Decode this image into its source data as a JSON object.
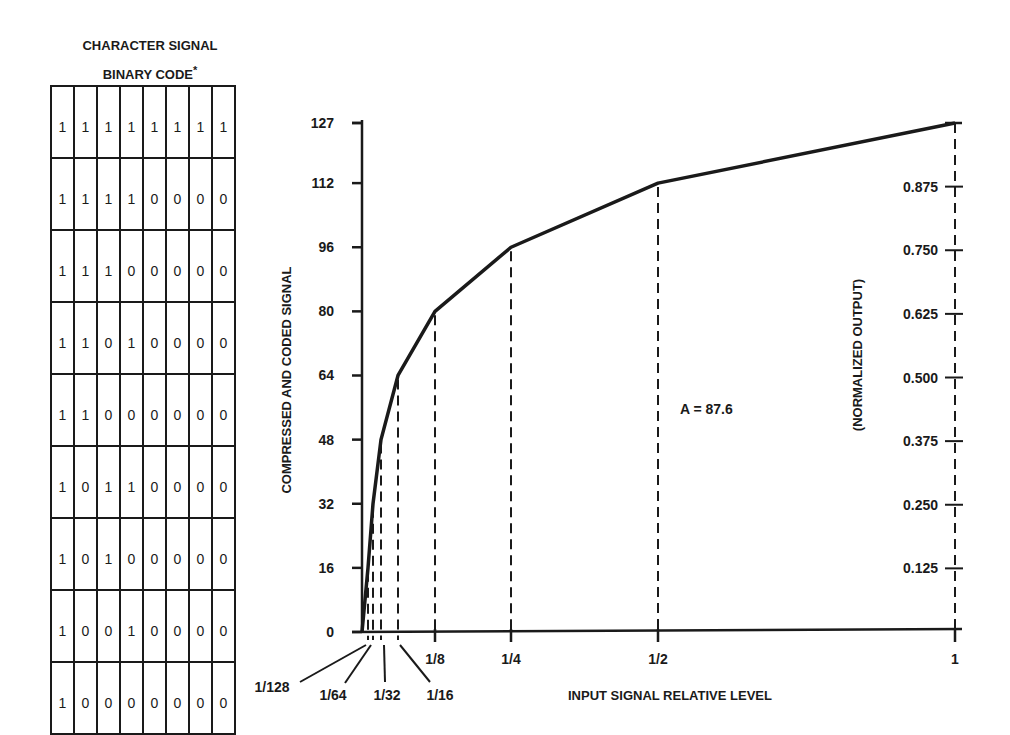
{
  "table": {
    "title_line1": "CHARACTER SIGNAL",
    "title_line2": "BINARY CODE",
    "title_mark": "*",
    "rows": [
      [
        "1",
        "1",
        "1",
        "1",
        "1",
        "1",
        "1",
        "1"
      ],
      [
        "1",
        "1",
        "1",
        "1",
        "0",
        "0",
        "0",
        "0"
      ],
      [
        "1",
        "1",
        "1",
        "0",
        "0",
        "0",
        "0",
        "0"
      ],
      [
        "1",
        "1",
        "0",
        "1",
        "0",
        "0",
        "0",
        "0"
      ],
      [
        "1",
        "1",
        "0",
        "0",
        "0",
        "0",
        "0",
        "0"
      ],
      [
        "1",
        "0",
        "1",
        "1",
        "0",
        "0",
        "0",
        "0"
      ],
      [
        "1",
        "0",
        "1",
        "0",
        "0",
        "0",
        "0",
        "0"
      ],
      [
        "1",
        "0",
        "0",
        "1",
        "0",
        "0",
        "0",
        "0"
      ],
      [
        "1",
        "0",
        "0",
        "0",
        "0",
        "0",
        "0",
        "0"
      ]
    ]
  },
  "chart": {
    "ylabel": "COMPRESSED AND CODED SIGNAL",
    "y2label": "(NORMALIZED OUTPUT)",
    "xlabel": "INPUT SIGNAL RELATIVE LEVEL",
    "annotation": "A = 87.6",
    "y_ticks": [
      "0",
      "16",
      "32",
      "48",
      "64",
      "80",
      "96",
      "112",
      "127"
    ],
    "y2_ticks": [
      "0.125",
      "0.250",
      "0.375",
      "0.500",
      "0.625",
      "0.750",
      "0.875"
    ],
    "x_ticks": [
      "1/128",
      "1/64",
      "1/32",
      "1/16",
      "1/8",
      "1/4",
      "1/2",
      "1"
    ]
  },
  "chart_data": {
    "type": "line",
    "title": "",
    "xlabel": "INPUT SIGNAL RELATIVE LEVEL",
    "ylabel": "COMPRESSED AND CODED SIGNAL",
    "y2label": "(NORMALIZED OUTPUT)",
    "annotation": "A = 87.6",
    "x": [
      0,
      0.0078125,
      0.015625,
      0.03125,
      0.0625,
      0.125,
      0.25,
      0.5,
      1
    ],
    "x_labels": [
      "0",
      "1/128",
      "1/64",
      "1/32",
      "1/16",
      "1/8",
      "1/4",
      "1/2",
      "1"
    ],
    "series": [
      {
        "name": "A-law compression curve",
        "values": [
          0,
          16,
          32,
          48,
          64,
          80,
          96,
          112,
          127
        ]
      }
    ],
    "y_ticks": [
      0,
      16,
      32,
      48,
      64,
      80,
      96,
      112,
      127
    ],
    "y2_ticks": [
      0.125,
      0.25,
      0.375,
      0.5,
      0.625,
      0.75,
      0.875
    ],
    "ylim": [
      0,
      127
    ],
    "xlim": [
      0,
      1
    ],
    "grid": false,
    "legend": "none",
    "table_binary_codes": [
      "11111111",
      "11110000",
      "11100000",
      "11010000",
      "11000000",
      "10110000",
      "10100000",
      "10010000",
      "10000000"
    ]
  }
}
